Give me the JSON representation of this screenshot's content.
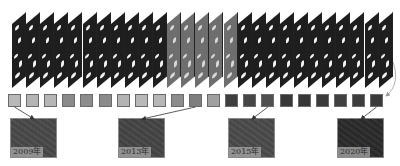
{
  "diagram": {
    "frames": {
      "count": 27,
      "start_x": 12,
      "pitch": 14.1,
      "light_section_indices": [
        11,
        12,
        13,
        14,
        15
      ],
      "dark_color": "#1e1e1e",
      "light_color": "#6e6e6e"
    },
    "squares": {
      "count": 21,
      "start_x": 8,
      "pitch": 18.1,
      "top": 94,
      "colors": [
        "#b8b8b8",
        "#b4b4b4",
        "#b6b6b6",
        "#8a8a8a",
        "#8c8c8c",
        "#8a8a8a",
        "#b4b4b4",
        "#b8b8b8",
        "#b6b6b6",
        "#8c8c8c",
        "#7e7e7e",
        "#a0a0a0",
        "#3e3e3e",
        "#464646",
        "#505050",
        "#383838",
        "#363636",
        "#3a3a3a",
        "#404040",
        "#3c3c3c",
        "#3a3a3a"
      ]
    },
    "thumbnails": [
      {
        "label": "2009年",
        "x": 10,
        "y": 118,
        "color": "#4a4a4a",
        "source_square": 0
      },
      {
        "label": "2013年",
        "x": 118,
        "y": 118,
        "color": "#464646",
        "source_square": 10
      },
      {
        "label": "2015年",
        "x": 228,
        "y": 118,
        "color": "#4c4c4c",
        "source_square": 14
      },
      {
        "label": "2020年",
        "x": 337,
        "y": 118,
        "color": "#2c2c2c",
        "source_square": 20
      }
    ],
    "arrow_color": "#333333",
    "curve_arrow_color": "#9a9a9a"
  }
}
